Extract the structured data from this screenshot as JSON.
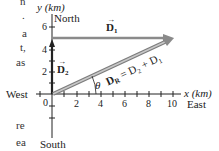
{
  "figure": {
    "y_axis_label": "y (km)",
    "x_axis_label": "x (km)",
    "north": "North",
    "south": "South",
    "east": "East",
    "west": "West",
    "x_ticks": [
      "0",
      "2",
      "4",
      "6",
      "8",
      "10"
    ],
    "y_ticks": [
      "2",
      "4",
      "6"
    ],
    "vectors": {
      "d1": {
        "symbol": "D",
        "subscript": "1",
        "from": [
          0,
          5
        ],
        "to": [
          10,
          5
        ]
      },
      "d2": {
        "symbol": "D",
        "subscript": "2",
        "from": [
          0,
          0
        ],
        "to": [
          0,
          5
        ]
      },
      "dr": {
        "symbol": "D",
        "subscript": "R",
        "equation": "= D₂ + D₁",
        "from": [
          0,
          0
        ],
        "to": [
          10,
          5
        ]
      }
    },
    "angle_label": "θ",
    "colors": {
      "d1": "#8a8a8a",
      "dr": "#8a8a8a",
      "d2": "#222222",
      "axis": "#222222"
    }
  },
  "margin_text": {
    "lines": [
      "n",
      ".",
      "a",
      "t,",
      "as",
      "re",
      "ea"
    ]
  }
}
